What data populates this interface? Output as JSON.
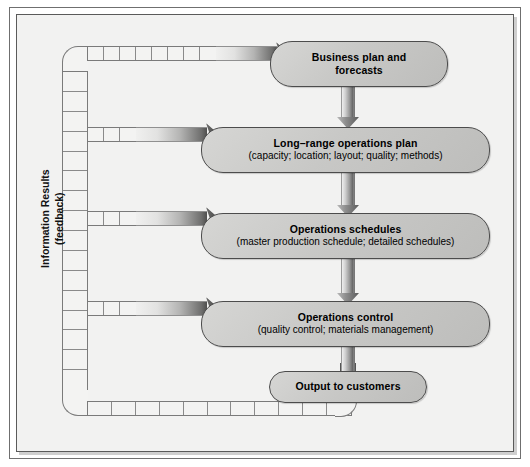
{
  "diagram": {
    "feedback_label_line1": "Information Results",
    "feedback_label_line2": "(feedback)",
    "colors": {
      "box_fill_light": "#d6d6d4",
      "box_fill_dark": "#bdbdbb",
      "box_border": "#4c4c4c",
      "arrow_dark": "#4f4f4e",
      "arrow_light": "#f0f0ef",
      "canvas": "#f2f2f1",
      "frame_border": "#5a5a5a"
    },
    "nodes": [
      {
        "id": "business-plan",
        "title": "Business plan and",
        "title2": "forecasts",
        "subtitle": ""
      },
      {
        "id": "long-range-operations-plan",
        "title": "Long–range operations plan",
        "subtitle": "(capacity; location; layout; quality; methods)"
      },
      {
        "id": "operations-schedules",
        "title": "Operations schedules",
        "subtitle": "(master production schedule; detailed schedules)"
      },
      {
        "id": "operations-control",
        "title": "Operations control",
        "subtitle": "(quality control; materials management)"
      },
      {
        "id": "output-to-customers",
        "title": "Output to customers",
        "subtitle": ""
      }
    ],
    "flow_arrows": [
      {
        "from": "business-plan",
        "to": "long-range-operations-plan"
      },
      {
        "from": "long-range-operations-plan",
        "to": "operations-schedules"
      },
      {
        "from": "operations-schedules",
        "to": "operations-control"
      },
      {
        "from": "operations-control",
        "to": "output-to-customers"
      }
    ],
    "feedback_arrows": [
      {
        "to": "business-plan"
      },
      {
        "to": "long-range-operations-plan"
      },
      {
        "to": "operations-schedules"
      },
      {
        "to": "operations-control"
      }
    ]
  }
}
